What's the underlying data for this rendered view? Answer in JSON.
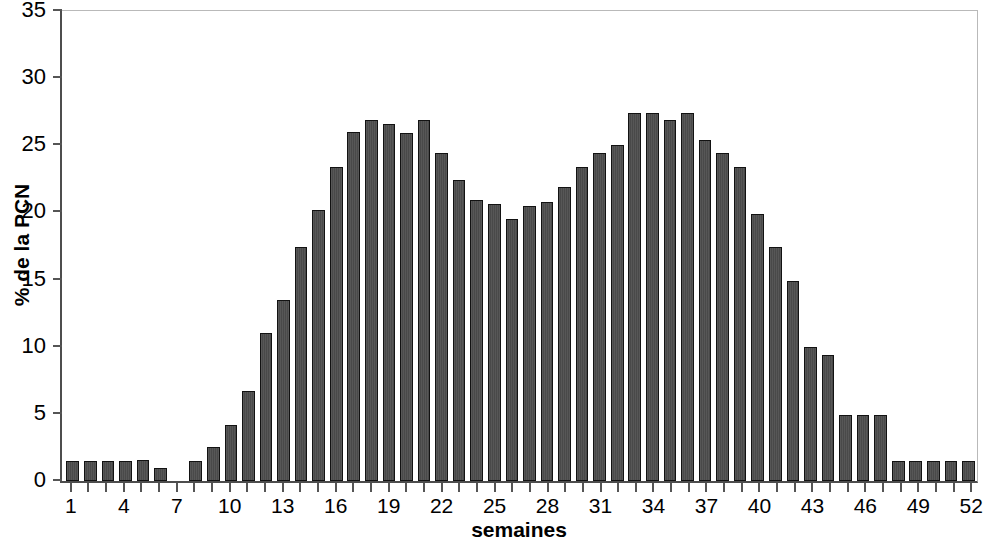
{
  "chart_data": {
    "type": "bar",
    "title": "",
    "subtitle": "",
    "xlabel": "semaines",
    "ylabel": "% de la PCN",
    "xlim": [
      0.5,
      52.5
    ],
    "ylim": [
      0,
      35
    ],
    "ytick_step": 5,
    "yticks": [
      0,
      5,
      10,
      15,
      20,
      25,
      30,
      35
    ],
    "ytick_labels": [
      "0",
      "5",
      "10",
      "15",
      "20",
      "25",
      "30",
      "35"
    ],
    "xticks": [
      1,
      4,
      7,
      10,
      13,
      16,
      19,
      22,
      25,
      28,
      31,
      34,
      37,
      40,
      43,
      46,
      49,
      52
    ],
    "xtick_labels": [
      "1",
      "4",
      "7",
      "10",
      "13",
      "16",
      "19",
      "22",
      "25",
      "28",
      "31",
      "34",
      "37",
      "40",
      "43",
      "46",
      "49",
      "52"
    ],
    "grid": false,
    "legend": null,
    "bar_color": "#4d4d4d",
    "bar_edge_color": "#121212",
    "axis_color": "#555555",
    "categories": [
      1,
      2,
      3,
      4,
      5,
      6,
      7,
      8,
      9,
      10,
      11,
      12,
      13,
      14,
      15,
      16,
      17,
      18,
      19,
      20,
      21,
      22,
      23,
      24,
      25,
      26,
      27,
      28,
      29,
      30,
      31,
      32,
      33,
      34,
      35,
      36,
      37,
      38,
      39,
      40,
      41,
      42,
      43,
      44,
      45,
      46,
      47,
      48,
      49,
      50,
      51,
      52
    ],
    "values": [
      1.5,
      1.5,
      1.5,
      1.5,
      1.6,
      1.0,
      0.0,
      1.5,
      2.5,
      4.2,
      6.7,
      11.0,
      13.5,
      17.4,
      20.2,
      23.4,
      26.0,
      26.9,
      26.6,
      25.9,
      26.9,
      24.4,
      22.4,
      20.9,
      20.6,
      19.5,
      20.5,
      20.8,
      21.9,
      23.4,
      24.4,
      25.0,
      27.4,
      27.4,
      26.9,
      27.4,
      25.4,
      24.4,
      23.4,
      19.9,
      17.4,
      14.9,
      10.0,
      9.4,
      4.9,
      4.9,
      4.9,
      1.5,
      1.5,
      1.5,
      1.5,
      1.5
    ]
  }
}
